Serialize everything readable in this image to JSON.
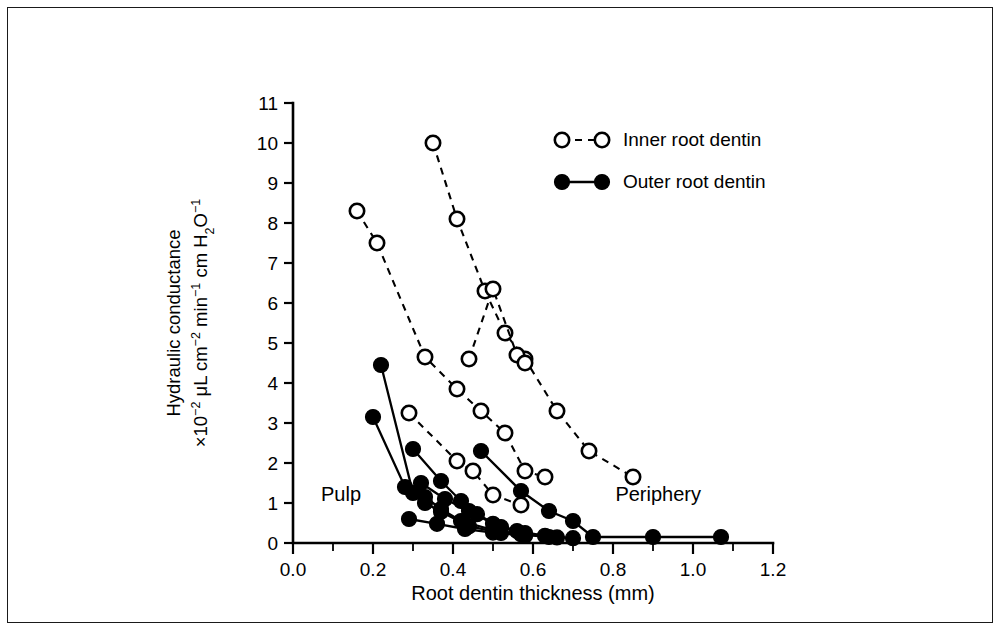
{
  "figure": {
    "frame_color": "#1a1a1a",
    "background": "#ffffff"
  },
  "chart_data": {
    "type": "scatter",
    "title": "",
    "subtitle": "",
    "xlabel": "Root dentin thickness (mm)",
    "ylabel_line1": "Hydraulic conductance",
    "ylabel_line2_parts": {
      "lead": "×10",
      "lead_sup": "−2",
      "mid": " μL cm",
      "mid_sup": "−2",
      "mid2": " min",
      "mid2_sup": "−1",
      "tail": " cm H",
      "tail_sub": "2",
      "tail2": "O",
      "tail2_sup": "−1"
    },
    "ylabel_plain": "Hydraulic conductance ×10⁻² μL cm⁻² min⁻¹ cm H₂O⁻¹",
    "xlim": [
      0.0,
      1.2
    ],
    "ylim": [
      0,
      11
    ],
    "x_ticks": [
      0.0,
      0.2,
      0.4,
      0.6,
      0.8,
      1.0,
      1.2
    ],
    "x_tick_labels": [
      "0.0",
      "0.2",
      "0.4",
      "0.6",
      "0.8",
      "1.0",
      "1.2"
    ],
    "x_minor_step": 0.1,
    "y_ticks": [
      0,
      1,
      2,
      3,
      4,
      5,
      6,
      7,
      8,
      9,
      10,
      11
    ],
    "y_tick_labels": [
      "0",
      "1",
      "2",
      "3",
      "4",
      "5",
      "6",
      "7",
      "8",
      "9",
      "10",
      "11"
    ],
    "grid": false,
    "legend_position": "top-right",
    "marker_color": "#000000",
    "line_color": "#000000",
    "annotations": [
      {
        "text": "Pulp",
        "x": 0.07,
        "y": 1.05,
        "name": "pulp-label"
      },
      {
        "text": "Periphery",
        "x": 1.02,
        "y": 1.05,
        "name": "periphery-label"
      }
    ],
    "legend": [
      {
        "label": "Inner root dentin",
        "marker": "open-circle",
        "line_style": "dashed",
        "name": "legend-inner-root-dentin"
      },
      {
        "label": "Outer root dentin",
        "marker": "filled-circle",
        "line_style": "solid",
        "name": "legend-outer-root-dentin"
      }
    ],
    "series": [
      {
        "name": "Inner root dentin",
        "group": "inner",
        "marker": "open-circle",
        "line_style": "dashed",
        "curves": [
          {
            "id": "inner-1",
            "points": [
              [
                0.16,
                8.3
              ],
              [
                0.21,
                7.5
              ],
              [
                0.33,
                4.65
              ],
              [
                0.41,
                3.85
              ],
              [
                0.47,
                3.3
              ],
              [
                0.53,
                2.75
              ],
              [
                0.58,
                1.8
              ],
              [
                0.63,
                1.65
              ]
            ]
          },
          {
            "id": "inner-2",
            "points": [
              [
                0.35,
                10.0
              ],
              [
                0.41,
                8.1
              ],
              [
                0.48,
                6.3
              ],
              [
                0.53,
                5.25
              ],
              [
                0.58,
                4.6
              ],
              [
                0.66,
                3.3
              ],
              [
                0.74,
                2.3
              ],
              [
                0.85,
                1.65
              ]
            ]
          },
          {
            "id": "inner-3",
            "points": [
              [
                0.29,
                3.25
              ],
              [
                0.41,
                2.05
              ],
              [
                0.45,
                1.8
              ],
              [
                0.5,
                1.2
              ],
              [
                0.57,
                0.95
              ]
            ]
          },
          {
            "id": "inner-4",
            "points": [
              [
                0.44,
                4.6
              ],
              [
                0.5,
                6.35
              ],
              [
                0.56,
                4.7
              ],
              [
                0.58,
                4.5
              ]
            ]
          }
        ]
      },
      {
        "name": "Outer root dentin",
        "group": "outer",
        "marker": "filled-circle",
        "line_style": "solid",
        "curves": [
          {
            "id": "outer-1",
            "points": [
              [
                0.22,
                4.45
              ],
              [
                0.3,
                1.25
              ],
              [
                0.33,
                1.0
              ],
              [
                0.37,
                0.78
              ],
              [
                0.44,
                0.42
              ],
              [
                0.52,
                0.25
              ],
              [
                0.58,
                0.18
              ]
            ]
          },
          {
            "id": "outer-2",
            "points": [
              [
                0.2,
                3.15
              ],
              [
                0.28,
                1.4
              ],
              [
                0.33,
                1.15
              ],
              [
                0.37,
                0.85
              ],
              [
                0.42,
                0.55
              ],
              [
                0.5,
                0.32
              ],
              [
                0.57,
                0.22
              ]
            ]
          },
          {
            "id": "outer-3",
            "points": [
              [
                0.3,
                2.35
              ],
              [
                0.37,
                1.55
              ],
              [
                0.42,
                1.05
              ],
              [
                0.46,
                0.72
              ],
              [
                0.52,
                0.4
              ],
              [
                0.58,
                0.25
              ],
              [
                0.64,
                0.15
              ]
            ]
          },
          {
            "id": "outer-4",
            "points": [
              [
                0.32,
                1.5
              ],
              [
                0.38,
                1.1
              ],
              [
                0.44,
                0.8
              ],
              [
                0.5,
                0.48
              ],
              [
                0.56,
                0.3
              ],
              [
                0.63,
                0.18
              ],
              [
                0.7,
                0.12
              ]
            ]
          },
          {
            "id": "outer-5",
            "points": [
              [
                0.47,
                2.3
              ],
              [
                0.57,
                1.3
              ],
              [
                0.64,
                0.8
              ],
              [
                0.7,
                0.55
              ],
              [
                0.75,
                0.15
              ],
              [
                0.9,
                0.15
              ],
              [
                1.07,
                0.15
              ]
            ]
          },
          {
            "id": "outer-6",
            "points": [
              [
                0.29,
                0.6
              ],
              [
                0.36,
                0.48
              ],
              [
                0.43,
                0.35
              ],
              [
                0.5,
                0.26
              ],
              [
                0.58,
                0.2
              ],
              [
                0.66,
                0.14
              ]
            ]
          }
        ]
      }
    ]
  }
}
